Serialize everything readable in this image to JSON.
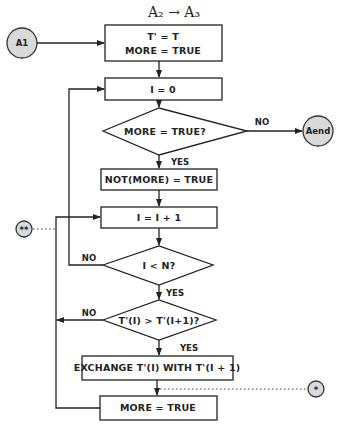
{
  "diagram": {
    "title": "A₂ → A₃",
    "connectors": {
      "start": "A1",
      "end": "Aend",
      "double_star": "**",
      "single_star": "*"
    },
    "nodes": {
      "init_line1": "T' = T",
      "init_line2": "MORE = TRUE",
      "set_i_zero": "I = 0",
      "decision_more": "MORE = TRUE?",
      "not_more": "NOT(MORE) = TRUE",
      "increment_i": "I = I + 1",
      "decision_i_lt_n": "I < N?",
      "decision_compare": "T'(I) > T'(I+1)?",
      "exchange": "EXCHANGE T'(I) WITH T'(I + 1)",
      "set_more_true": "MORE = TRUE"
    },
    "edge_labels": {
      "more_no": "NO",
      "more_yes": "YES",
      "i_lt_n_no": "NO",
      "i_lt_n_yes": "YES",
      "compare_no": "NO",
      "compare_yes": "YES"
    }
  }
}
